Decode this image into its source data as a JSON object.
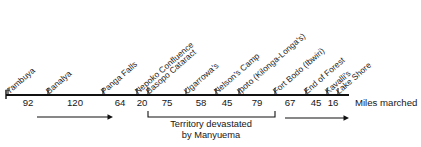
{
  "figure": {
    "axis_caption": "Miles marched",
    "stations": [
      {
        "label": "Yambuya",
        "x": 8
      },
      {
        "label": "Banalya",
        "x": 48
      },
      {
        "label": "Panga Falls",
        "x": 103
      },
      {
        "label": "Nepoko Confluence",
        "x": 137
      },
      {
        "label": "Basopo Cataract",
        "x": 148
      },
      {
        "label": "Ugarrowa's",
        "x": 186
      },
      {
        "label": "Nelson's Camp",
        "x": 216
      },
      {
        "label": "Ipoto (Kilonga-Longa's)",
        "x": 239
      },
      {
        "label": "Fort Bodo (Ibwiri)",
        "x": 275
      },
      {
        "label": "End of Forest",
        "x": 306
      },
      {
        "label": "Kavalli's",
        "x": 327
      },
      {
        "label": "Lake Shore",
        "x": 338
      }
    ],
    "segments": [
      {
        "value": "92",
        "from": "Yambuya",
        "to": "Banalya",
        "x": 28
      },
      {
        "value": "120",
        "from": "Banalya",
        "to": "Panga Falls",
        "x": 75
      },
      {
        "value": "64",
        "from": "Panga Falls",
        "to": "Nepoko Confluence",
        "x": 120
      },
      {
        "value": "20",
        "from": "Nepoko Confluence",
        "to": "Basopo Cataract",
        "x": 142
      },
      {
        "value": "75",
        "from": "Basopo Cataract",
        "to": "Ugarrowa's",
        "x": 167
      },
      {
        "value": "58",
        "from": "Ugarrowa's",
        "to": "Nelson's Camp",
        "x": 201
      },
      {
        "value": "45",
        "from": "Nelson's Camp",
        "to": "Ipoto (Kilonga-Longa's)",
        "x": 227
      },
      {
        "value": "79",
        "from": "Ipoto (Kilonga-Longa's)",
        "to": "Fort Bodo (Ibwiri)",
        "x": 257
      },
      {
        "value": "67",
        "from": "Fort Bodo (Ibwiri)",
        "to": "End of Forest",
        "x": 290
      },
      {
        "value": "45",
        "from": "End of Forest",
        "to": "Kavalli's",
        "x": 316
      },
      {
        "value": "16",
        "from": "Kavalli's",
        "to": "Lake Shore",
        "x": 333
      }
    ],
    "bracket": {
      "caption_line1": "Territory devastated",
      "caption_line2": "by Manyuema",
      "start_x": 148,
      "end_x": 275,
      "center_x": 211
    },
    "arrows": [
      {
        "name": "advance-arrow-left",
        "x1": 37,
        "x2": 113,
        "y": 117
      },
      {
        "name": "advance-arrow-right",
        "x1": 285,
        "x2": 349,
        "y": 118
      }
    ],
    "axis": {
      "y": 95,
      "start_x": 6,
      "end_x": 349,
      "tick_height": 7,
      "line_color": "#111111"
    }
  },
  "chart_data": {
    "type": "bar",
    "xlabel": "Miles marched",
    "ylabel": "",
    "categories": [
      "Yambuya – Banalya",
      "Banalya – Panga Falls",
      "Panga Falls – Nepoko Confluence",
      "Nepoko Confluence – Basopo Cataract",
      "Basopo Cataract – Ugarrowa's",
      "Ugarrowa's – Nelson's Camp",
      "Nelson's Camp – Ipoto (Kilonga-Longa's)",
      "Ipoto (Kilonga-Longa's) – Fort Bodo (Ibwiri)",
      "Fort Bodo (Ibwiri) – End of Forest",
      "End of Forest – Kavalli's",
      "Kavalli's – Lake Shore"
    ],
    "values": [
      92,
      120,
      64,
      20,
      75,
      58,
      45,
      79,
      67,
      45,
      16
    ],
    "total_miles": 681,
    "annotations": [
      "Territory devastated by Manyuema (Basopo Cataract → Fort Bodo (Ibwiri))",
      "Miles marched"
    ],
    "legend": [],
    "grid": false
  }
}
